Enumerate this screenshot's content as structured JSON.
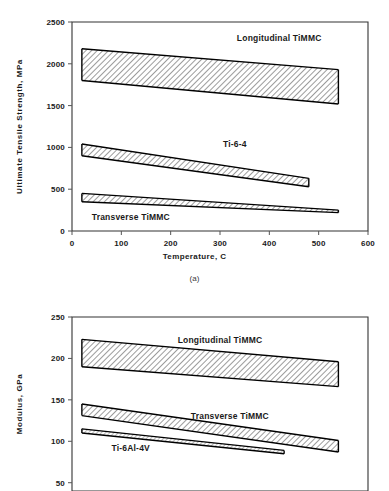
{
  "figure": {
    "subcaption_a": "(a)",
    "cropped_title_hint": ""
  },
  "chart_data": [
    {
      "id": "chart-a",
      "type": "area",
      "title": "",
      "xlabel": "Temperature, C",
      "ylabel": "Ultimate Tensile Strength, MPa",
      "xlim": [
        0,
        600
      ],
      "ylim": [
        0,
        2500
      ],
      "xticks": [
        0,
        100,
        200,
        300,
        400,
        500,
        600
      ],
      "xtick_labels": [
        "0",
        "100",
        "200",
        "300",
        "400",
        "500",
        "600"
      ],
      "yticks": [
        0,
        500,
        1000,
        1500,
        2000,
        2500
      ],
      "ytick_labels": [
        "0",
        "500",
        "1000",
        "1500",
        "2000",
        "2500"
      ],
      "grid": false,
      "legend_position": "inline-annotations",
      "bands": [
        {
          "name": "Longitudinal TiMMC",
          "label": "Longitudinal TiMMC",
          "label_x": 420,
          "label_y": 2270,
          "fill": "hatch",
          "x": [
            20,
            540
          ],
          "upper": [
            2180,
            1930
          ],
          "lower": [
            1800,
            1520
          ]
        },
        {
          "name": "Ti-6-4",
          "label": "Ti-6-4",
          "label_x": 330,
          "label_y": 1010,
          "fill": "hatch",
          "x": [
            20,
            480
          ],
          "upper": [
            1040,
            630
          ],
          "lower": [
            900,
            530
          ]
        },
        {
          "name": "Transverse TiMMC",
          "label": "Transverse TiMMC",
          "label_x": 40,
          "label_y": 130,
          "fill": "hatch",
          "x": [
            20,
            540
          ],
          "upper": [
            450,
            250
          ],
          "lower": [
            350,
            220
          ]
        }
      ]
    },
    {
      "id": "chart-b",
      "type": "area",
      "title": "",
      "xlabel": "",
      "ylabel": "Modulus, GPa",
      "xlim": [
        0,
        600
      ],
      "ylim": [
        40,
        250
      ],
      "xticks": [],
      "xtick_labels": [],
      "yticks": [
        50,
        100,
        150,
        200,
        250
      ],
      "ytick_labels": [
        "50",
        "100",
        "150",
        "200",
        "250"
      ],
      "grid": false,
      "legend_position": "inline-annotations",
      "bands": [
        {
          "name": "Longitudinal TiMMC",
          "label": "Longitudinal TiMMC",
          "label_x": 300,
          "label_y": 219,
          "fill": "hatch",
          "x": [
            20,
            540
          ],
          "upper": [
            223,
            196
          ],
          "lower": [
            190,
            166
          ]
        },
        {
          "name": "Transverse TiMMC",
          "label": "Transverse TiMMC",
          "label_x": 320,
          "label_y": 127,
          "fill": "hatch",
          "x": [
            20,
            540
          ],
          "upper": [
            145,
            101
          ],
          "lower": [
            131,
            87
          ]
        },
        {
          "name": "Ti-6Al-4V",
          "label": "Ti-6Al-4V",
          "label_x": 80,
          "label_y": 88,
          "fill": "hatch-light",
          "x": [
            20,
            430
          ],
          "upper": [
            115,
            89
          ],
          "lower": [
            110,
            85
          ]
        }
      ]
    }
  ]
}
